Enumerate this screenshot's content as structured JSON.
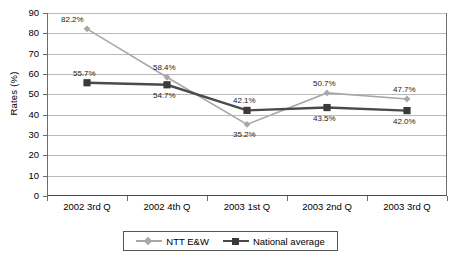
{
  "chart_data": {
    "type": "line",
    "title": "",
    "xlabel": "",
    "ylabel": "Rates (%)",
    "ylim": [
      0,
      90
    ],
    "ytick_step": 10,
    "grid": true,
    "legend_position": "bottom",
    "categories": [
      "2002 3rd Q",
      "2002 4th Q",
      "2003 1st Q",
      "2003 2nd Q",
      "2003 3rd Q"
    ],
    "ytick_labels": [
      "90",
      "80",
      "70",
      "60",
      "50",
      "40",
      "30",
      "20",
      "10",
      "0"
    ],
    "series": [
      {
        "name": "NTT E&W",
        "marker": "diamond",
        "color": "#a8a8a8",
        "values": [
          82.2,
          58.4,
          35.2,
          50.7,
          47.7
        ],
        "data_labels": [
          "82.2%",
          "58.4%",
          "35.2%",
          "50.7%",
          "47.7%"
        ]
      },
      {
        "name": "National average",
        "marker": "square",
        "color": "#4a4a4a",
        "values": [
          55.7,
          54.7,
          42.1,
          43.5,
          42.0
        ],
        "data_labels": [
          "55.7%",
          "54.7%",
          "42.1%",
          "43.5%",
          "42.0%"
        ]
      }
    ]
  },
  "legend": {
    "items": [
      {
        "label": "NTT E&W"
      },
      {
        "label": "National average"
      }
    ]
  },
  "colors": {
    "series_ntt": "#a8a8a8",
    "series_national": "#4a4a4a",
    "gridline": "#b9b9b9",
    "axis": "#6e6e6e",
    "text": "#000000"
  }
}
